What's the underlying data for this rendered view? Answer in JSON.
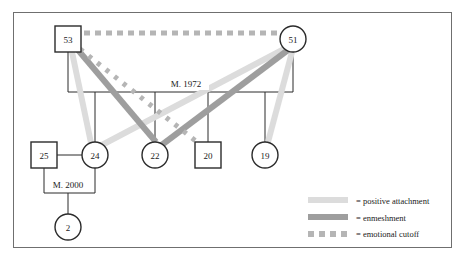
{
  "diagram": {
    "frame": {
      "x": 13,
      "y": 12,
      "width": 439,
      "height": 236
    },
    "colors": {
      "outline": "#2b2b2b",
      "frame": "#6f6f6f",
      "positive_attachment": "#d9d9d9",
      "enmeshment": "#9a9a9a",
      "emotional_cutoff": "#b0b0b0",
      "structure_line": "#2b2b2b",
      "text": "#1a1a1a"
    },
    "nodes": [
      {
        "id": "n53",
        "label": "53",
        "shape": "square",
        "cx": 68,
        "cy": 39,
        "size": 26
      },
      {
        "id": "n51",
        "label": "51",
        "shape": "circle",
        "cx": 293,
        "cy": 39,
        "size": 26
      },
      {
        "id": "n25",
        "label": "25",
        "shape": "square",
        "cx": 44,
        "cy": 155,
        "size": 26
      },
      {
        "id": "n24",
        "label": "24",
        "shape": "circle",
        "cx": 95,
        "cy": 155,
        "size": 26
      },
      {
        "id": "n22",
        "label": "22",
        "shape": "circle",
        "cx": 155,
        "cy": 155,
        "size": 26
      },
      {
        "id": "n20",
        "label": "20",
        "shape": "square",
        "cx": 208,
        "cy": 155,
        "size": 26
      },
      {
        "id": "n19",
        "label": "19",
        "shape": "circle",
        "cx": 265,
        "cy": 155,
        "size": 26
      },
      {
        "id": "n2",
        "label": "2",
        "shape": "circle",
        "cx": 68,
        "cy": 227,
        "size": 26
      }
    ],
    "marriage_labels": [
      {
        "id": "m1972",
        "text": "M. 1972",
        "x": 186,
        "y": 87
      },
      {
        "id": "m2000",
        "text": "M. 2000",
        "x": 68,
        "y": 188
      }
    ],
    "legend": {
      "items": [
        {
          "key": "positive-attachment",
          "swatch": "solid-light",
          "color": "#d9d9d9",
          "label": "= positive attachment"
        },
        {
          "key": "enmeshment",
          "swatch": "solid-dark",
          "color": "#9a9a9a",
          "label": "= enmeshment"
        },
        {
          "key": "emotional-cutoff",
          "swatch": "dotted",
          "color": "#b0b0b0",
          "label": "= emotional cutoff"
        }
      ],
      "x": 308,
      "y": 201,
      "row_gap": 17
    },
    "relationships": [
      {
        "from": "n53",
        "to": "n24",
        "type": "positive_attachment"
      },
      {
        "from": "n53",
        "to": "n22",
        "type": "enmeshment"
      },
      {
        "from": "n53",
        "to": "n20",
        "type": "emotional_cutoff"
      },
      {
        "from": "n53",
        "to": "n51",
        "type": "emotional_cutoff"
      },
      {
        "from": "n51",
        "to": "n24",
        "type": "positive_attachment"
      },
      {
        "from": "n51",
        "to": "n22",
        "type": "enmeshment"
      },
      {
        "from": "n51",
        "to": "n19",
        "type": "positive_attachment"
      }
    ]
  }
}
